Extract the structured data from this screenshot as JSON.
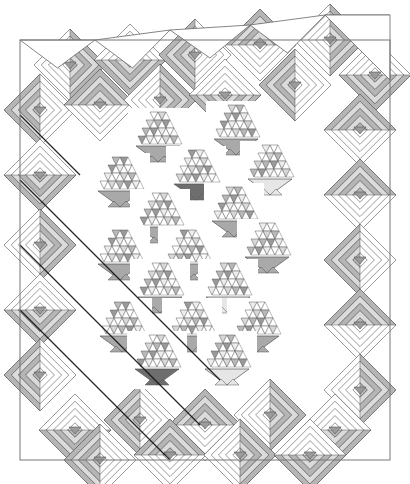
{
  "caption": "Basket quilt with log cabin diagonal border (grayscale design drawing)",
  "canvas": {
    "width": 410,
    "height": 484,
    "background": "#ffffff"
  },
  "colors": {
    "line": "#555555",
    "dark_line": "#111111",
    "strip_light": "#ffffff",
    "strip_mid": "#cfcfcf",
    "strip_dark": "#9c9c9c",
    "basket_gray": "#a9a9a9",
    "basket_dark": "#6e6e6e",
    "basket_light": "#e6e6e6",
    "tri_shades": [
      "#ffffff",
      "#d8d8d8",
      "#b8b8b8",
      "#9a9a9a",
      "#ededed"
    ]
  },
  "frame": {
    "x": 20,
    "y": 40,
    "w": 370,
    "h": 420
  },
  "top_triangles": [
    [
      20,
      40,
      95,
      40
    ],
    [
      95,
      40,
      170,
      30
    ],
    [
      170,
      30,
      250,
      25
    ],
    [
      250,
      25,
      325,
      15
    ],
    [
      325,
      15,
      390,
      15
    ]
  ],
  "log_cabins": {
    "size": 36,
    "rings": 5,
    "centers": [
      [
        70,
        65
      ],
      [
        130,
        60
      ],
      [
        195,
        55
      ],
      [
        260,
        45
      ],
      [
        330,
        40
      ],
      [
        375,
        75
      ],
      [
        40,
        110
      ],
      [
        100,
        105
      ],
      [
        160,
        100
      ],
      [
        225,
        95
      ],
      [
        295,
        85
      ],
      [
        360,
        130
      ],
      [
        40,
        175
      ],
      [
        360,
        195
      ],
      [
        40,
        245
      ],
      [
        360,
        260
      ],
      [
        40,
        310
      ],
      [
        360,
        325
      ],
      [
        40,
        375
      ],
      [
        360,
        390
      ],
      [
        75,
        430
      ],
      [
        140,
        420
      ],
      [
        205,
        425
      ],
      [
        270,
        415
      ],
      [
        335,
        430
      ],
      [
        100,
        460
      ],
      [
        170,
        455
      ],
      [
        240,
        455
      ],
      [
        310,
        455
      ]
    ],
    "dark_sides": [
      0,
      1,
      2,
      3,
      0,
      1,
      2,
      3,
      0,
      1,
      2,
      3,
      1,
      3,
      0,
      2,
      1,
      3,
      2,
      0,
      1,
      2,
      3,
      0,
      1,
      2,
      3,
      0,
      1
    ]
  },
  "diagonal_lines": [
    [
      20,
      115,
      80,
      175
    ],
    [
      20,
      180,
      220,
      380
    ],
    [
      20,
      245,
      200,
      425
    ],
    [
      20,
      310,
      170,
      460
    ],
    [
      60,
      40,
      380,
      360
    ],
    [
      140,
      40,
      390,
      290
    ],
    [
      220,
      40,
      390,
      210
    ],
    [
      100,
      100,
      300,
      300
    ],
    [
      140,
      180,
      330,
      370
    ],
    [
      60,
      300,
      180,
      420
    ],
    [
      250,
      400,
      310,
      460
    ],
    [
      320,
      400,
      380,
      460
    ]
  ],
  "baskets": [
    {
      "cx": 158,
      "top": 112,
      "apex": 162,
      "tone": "basket_gray"
    },
    {
      "cx": 236,
      "top": 105,
      "apex": 155,
      "tone": "basket_gray"
    },
    {
      "cx": 120,
      "top": 157,
      "apex": 207,
      "tone": "basket_gray"
    },
    {
      "cx": 196,
      "top": 150,
      "apex": 200,
      "tone": "basket_dark"
    },
    {
      "cx": 270,
      "top": 145,
      "apex": 195,
      "tone": "basket_light"
    },
    {
      "cx": 160,
      "top": 193,
      "apex": 243,
      "tone": "basket_gray"
    },
    {
      "cx": 234,
      "top": 187,
      "apex": 237,
      "tone": "basket_gray"
    },
    {
      "cx": 120,
      "top": 230,
      "apex": 280,
      "tone": "basket_gray"
    },
    {
      "cx": 188,
      "top": 230,
      "apex": 280,
      "tone": "basket_gray"
    },
    {
      "cx": 267,
      "top": 223,
      "apex": 273,
      "tone": "basket_gray"
    },
    {
      "cx": 160,
      "top": 263,
      "apex": 313,
      "tone": "basket_gray"
    },
    {
      "cx": 228,
      "top": 263,
      "apex": 313,
      "tone": "basket_light"
    },
    {
      "cx": 122,
      "top": 302,
      "apex": 352,
      "tone": "basket_gray"
    },
    {
      "cx": 192,
      "top": 302,
      "apex": 352,
      "tone": "basket_gray"
    },
    {
      "cx": 257,
      "top": 302,
      "apex": 352,
      "tone": "basket_gray"
    },
    {
      "cx": 157,
      "top": 335,
      "apex": 385,
      "tone": "basket_dark"
    },
    {
      "cx": 227,
      "top": 335,
      "apex": 385,
      "tone": "basket_light"
    }
  ]
}
